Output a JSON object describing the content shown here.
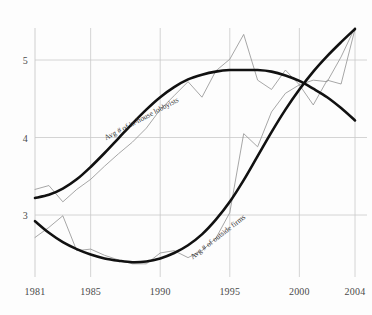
{
  "chart_data": {
    "type": "line",
    "title": "",
    "subtitle": "",
    "xlabel": "",
    "ylabel": "",
    "xlim": [
      1981,
      2004
    ],
    "ylim": [
      2.25,
      5.45
    ],
    "grid": true,
    "legend_position": "inline-annotations",
    "x_ticks": [
      1981,
      1985,
      1990,
      1995,
      2000,
      2004
    ],
    "x_tick_labels": [
      "1981",
      "1985",
      "1990",
      "1995",
      "2000",
      "2004"
    ],
    "y_ticks": [
      3,
      4,
      5
    ],
    "y_tick_labels": [
      "3",
      "4",
      "5"
    ],
    "x": [
      1981,
      1982,
      1983,
      1984,
      1985,
      1986,
      1987,
      1988,
      1989,
      1990,
      1991,
      1992,
      1993,
      1994,
      1995,
      1996,
      1997,
      1998,
      1999,
      2000,
      2001,
      2002,
      2003,
      2004
    ],
    "series": [
      {
        "name": "Avg # of in-house lobbyists",
        "style": "raw-jagged",
        "color": "#8a8a8a",
        "values": [
          3.33,
          3.38,
          3.17,
          3.33,
          3.46,
          3.63,
          3.79,
          3.94,
          4.12,
          4.36,
          4.54,
          4.72,
          4.52,
          4.86,
          5.01,
          5.33,
          4.74,
          4.62,
          4.87,
          4.68,
          4.42,
          4.74,
          4.69,
          5.4
        ]
      },
      {
        "name": "Avg # of in-house lobbyists (trend)",
        "style": "smooth-trend",
        "color": "#111111",
        "values": [
          3.22,
          3.26,
          3.34,
          3.46,
          3.62,
          3.8,
          3.99,
          4.18,
          4.36,
          4.52,
          4.65,
          4.75,
          4.81,
          4.85,
          4.87,
          4.87,
          4.87,
          4.85,
          4.8,
          4.73,
          4.63,
          4.52,
          4.38,
          4.22
        ]
      },
      {
        "name": "Avg # of outside firms",
        "style": "raw-jagged",
        "color": "#8a8a8a",
        "values": [
          2.71,
          2.84,
          2.99,
          2.54,
          2.56,
          2.48,
          2.42,
          2.37,
          2.37,
          2.51,
          2.54,
          2.45,
          2.54,
          2.7,
          3.03,
          4.05,
          3.88,
          4.33,
          4.57,
          4.68,
          4.74,
          4.72,
          5.04,
          5.42
        ]
      },
      {
        "name": "Avg # of outside firms (trend)",
        "style": "smooth-trend",
        "color": "#111111",
        "values": [
          2.92,
          2.77,
          2.65,
          2.56,
          2.49,
          2.44,
          2.41,
          2.39,
          2.4,
          2.44,
          2.51,
          2.61,
          2.75,
          2.94,
          3.17,
          3.45,
          3.76,
          4.07,
          4.36,
          4.62,
          4.85,
          5.05,
          5.23,
          5.4
        ]
      }
    ],
    "annotations": [
      {
        "text": "Avg # of in-house lobbyists",
        "x_year": 1986.2,
        "y_value": 4.06,
        "rotation": -28
      },
      {
        "text": "Avg # of outside firms",
        "x_year": 1992.4,
        "y_value": 2.52,
        "rotation": -38
      }
    ]
  }
}
